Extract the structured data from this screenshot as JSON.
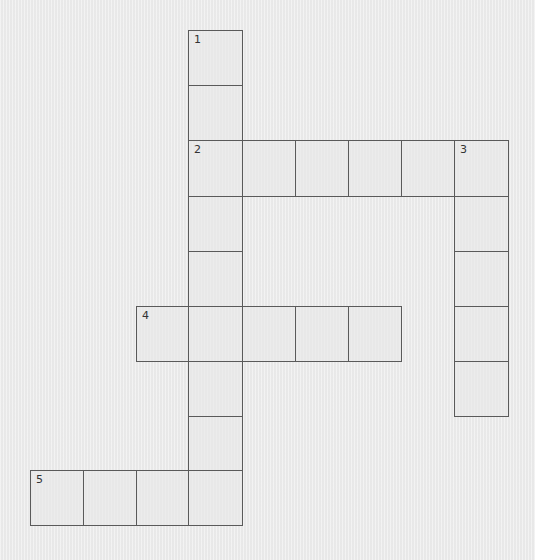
{
  "puzzle": {
    "type": "crossword",
    "cell_size": 54,
    "colors": {
      "background": "#ececec",
      "cell_fill": "#e8e8e8",
      "border": "#5a5a5a",
      "number": "#333333"
    },
    "column_x": [
      30,
      83,
      136,
      188,
      242,
      295,
      348,
      401,
      454
    ],
    "row_y": [
      30,
      85,
      140,
      196,
      251,
      306,
      361,
      416,
      470
    ],
    "clues": [
      {
        "number": "1",
        "direction": "down",
        "length": 9,
        "start_col": 3,
        "start_row": 0
      },
      {
        "number": "2",
        "direction": "across",
        "length": 6,
        "start_col": 3,
        "start_row": 2
      },
      {
        "number": "3",
        "direction": "down",
        "length": 5,
        "start_col": 8,
        "start_row": 2
      },
      {
        "number": "4",
        "direction": "across",
        "length": 5,
        "start_col": 2,
        "start_row": 5
      },
      {
        "number": "5",
        "direction": "across",
        "length": 4,
        "start_col": 0,
        "start_row": 8
      }
    ],
    "cells": [
      {
        "id": "r0c3",
        "col": 3,
        "row": 0,
        "number": "1",
        "value": ""
      },
      {
        "id": "r1c3",
        "col": 3,
        "row": 1,
        "number": "",
        "value": ""
      },
      {
        "id": "r2c3",
        "col": 3,
        "row": 2,
        "number": "2",
        "value": ""
      },
      {
        "id": "r2c4",
        "col": 4,
        "row": 2,
        "number": "",
        "value": ""
      },
      {
        "id": "r2c5",
        "col": 5,
        "row": 2,
        "number": "",
        "value": ""
      },
      {
        "id": "r2c6",
        "col": 6,
        "row": 2,
        "number": "",
        "value": ""
      },
      {
        "id": "r2c7",
        "col": 7,
        "row": 2,
        "number": "",
        "value": ""
      },
      {
        "id": "r2c8",
        "col": 8,
        "row": 2,
        "number": "3",
        "value": ""
      },
      {
        "id": "r3c3",
        "col": 3,
        "row": 3,
        "number": "",
        "value": ""
      },
      {
        "id": "r3c8",
        "col": 8,
        "row": 3,
        "number": "",
        "value": ""
      },
      {
        "id": "r4c3",
        "col": 3,
        "row": 4,
        "number": "",
        "value": ""
      },
      {
        "id": "r4c8",
        "col": 8,
        "row": 4,
        "number": "",
        "value": ""
      },
      {
        "id": "r5c2",
        "col": 2,
        "row": 5,
        "number": "4",
        "value": ""
      },
      {
        "id": "r5c3",
        "col": 3,
        "row": 5,
        "number": "",
        "value": ""
      },
      {
        "id": "r5c4",
        "col": 4,
        "row": 5,
        "number": "",
        "value": ""
      },
      {
        "id": "r5c5",
        "col": 5,
        "row": 5,
        "number": "",
        "value": ""
      },
      {
        "id": "r5c6",
        "col": 6,
        "row": 5,
        "number": "",
        "value": ""
      },
      {
        "id": "r5c8",
        "col": 8,
        "row": 5,
        "number": "",
        "value": ""
      },
      {
        "id": "r6c3",
        "col": 3,
        "row": 6,
        "number": "",
        "value": ""
      },
      {
        "id": "r6c8",
        "col": 8,
        "row": 6,
        "number": "",
        "value": ""
      },
      {
        "id": "r7c3",
        "col": 3,
        "row": 7,
        "number": "",
        "value": ""
      },
      {
        "id": "r8c0",
        "col": 0,
        "row": 8,
        "number": "5",
        "value": ""
      },
      {
        "id": "r8c1",
        "col": 1,
        "row": 8,
        "number": "",
        "value": ""
      },
      {
        "id": "r8c2",
        "col": 2,
        "row": 8,
        "number": "",
        "value": ""
      },
      {
        "id": "r8c3",
        "col": 3,
        "row": 8,
        "number": "",
        "value": ""
      }
    ]
  }
}
